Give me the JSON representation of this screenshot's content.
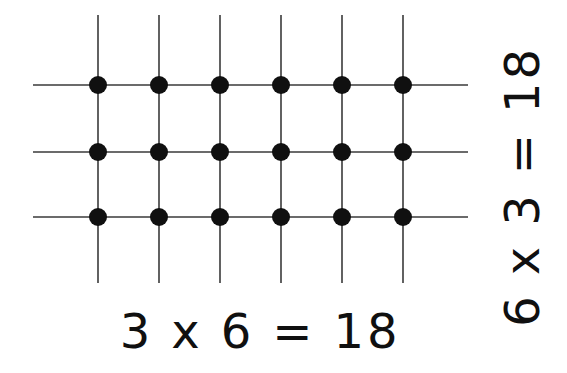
{
  "figure": {
    "background_color": "#ffffff",
    "line_color": "#3a3a3a",
    "dot_color": "#101010"
  },
  "equations": {
    "bottom": "3 x 6 = 18",
    "right": "6 x 3 = 18"
  },
  "chart_data": {
    "type": "scatter",
    "title": "",
    "xlabel": "3 x 6 = 18",
    "ylabel": "6 x 3 = 18",
    "columns": 6,
    "rows": 3,
    "total_dots": 18,
    "grid": true,
    "legend": "none",
    "x": [
      1,
      2,
      3,
      4,
      5,
      6
    ],
    "y": [
      1,
      2,
      3
    ],
    "points": [
      {
        "x": 1,
        "y": 1
      },
      {
        "x": 2,
        "y": 1
      },
      {
        "x": 3,
        "y": 1
      },
      {
        "x": 4,
        "y": 1
      },
      {
        "x": 5,
        "y": 1
      },
      {
        "x": 6,
        "y": 1
      },
      {
        "x": 1,
        "y": 2
      },
      {
        "x": 2,
        "y": 2
      },
      {
        "x": 3,
        "y": 2
      },
      {
        "x": 4,
        "y": 2
      },
      {
        "x": 5,
        "y": 2
      },
      {
        "x": 6,
        "y": 2
      },
      {
        "x": 1,
        "y": 3
      },
      {
        "x": 2,
        "y": 3
      },
      {
        "x": 3,
        "y": 3
      },
      {
        "x": 4,
        "y": 3
      },
      {
        "x": 5,
        "y": 3
      },
      {
        "x": 6,
        "y": 3
      }
    ],
    "pixel_layout": {
      "column_x": [
        98,
        159,
        220,
        281,
        342,
        403
      ],
      "row_y": [
        85,
        152,
        217
      ],
      "vertical_line_top": 15,
      "vertical_line_bottom": 283,
      "horizontal_line_left": 33,
      "horizontal_line_right": 468,
      "dot_radius": 9
    }
  }
}
